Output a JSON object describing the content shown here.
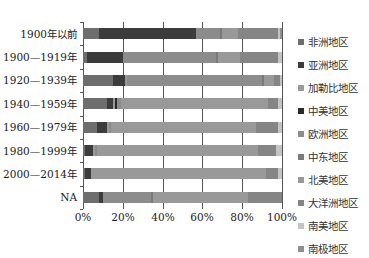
{
  "chart_data": {
    "type": "bar",
    "orientation": "horizontal",
    "stacked": "percent",
    "title": "",
    "xlabel": "",
    "ylabel": "",
    "xlim": [
      0,
      100
    ],
    "x_ticks": [
      "0%",
      "20%",
      "40%",
      "60%",
      "80%",
      "100%"
    ],
    "grid": true,
    "legend_position": "right",
    "categories": [
      "1900年以前",
      "1900—1919年",
      "1920—1939年",
      "1940—1959年",
      "1960—1979年",
      "1980—1999年",
      "2000—2014年",
      "NA"
    ],
    "series": [
      {
        "name": "非洲地区",
        "color": "#6e6e6e",
        "values": [
          8,
          2,
          15,
          12,
          7,
          1,
          1,
          8
        ]
      },
      {
        "name": "亚洲地区",
        "color": "#3c3c3c",
        "values": [
          49,
          18,
          6,
          3,
          5,
          4,
          3,
          2
        ]
      },
      {
        "name": "加勒比地区",
        "color": "#9a9a9a",
        "values": [
          0,
          0,
          1,
          1,
          1,
          1,
          1,
          0
        ]
      },
      {
        "name": "中美地区",
        "color": "#2a2a2a",
        "values": [
          0,
          0,
          0,
          1,
          0,
          0,
          0,
          0
        ]
      },
      {
        "name": "欧洲地区",
        "color": "#8c8c8c",
        "values": [
          12,
          47,
          68,
          2,
          1,
          1,
          0,
          24
        ]
      },
      {
        "name": "中东地区",
        "color": "#7a7a7a",
        "values": [
          1,
          1,
          1,
          0,
          0,
          0,
          0,
          1
        ]
      },
      {
        "name": "北美地区",
        "color": "#999999",
        "values": [
          8,
          11,
          5,
          74,
          73,
          81,
          87,
          48
        ]
      },
      {
        "name": "大洋洲地区",
        "color": "#858585",
        "values": [
          20,
          19,
          3,
          5,
          11,
          9,
          6,
          17
        ]
      },
      {
        "name": "南美地区",
        "color": "#c4c4c4",
        "values": [
          1,
          2,
          1,
          2,
          2,
          3,
          2,
          0
        ]
      },
      {
        "name": "南极地区",
        "color": "#8f8f8f",
        "values": [
          1,
          0,
          0,
          0,
          0,
          0,
          0,
          0
        ]
      }
    ]
  },
  "legend": {
    "items": [
      {
        "label": "非洲地区",
        "color": "#6e6e6e"
      },
      {
        "label": "亚洲地区",
        "color": "#3c3c3c"
      },
      {
        "label": "加勒比地区",
        "color": "#9a9a9a"
      },
      {
        "label": "中美地区",
        "color": "#2a2a2a"
      },
      {
        "label": "欧洲地区",
        "color": "#8c8c8c"
      },
      {
        "label": "中东地区",
        "color": "#7a7a7a"
      },
      {
        "label": "北美地区",
        "color": "#999999"
      },
      {
        "label": "大洋洲地区",
        "color": "#858585"
      },
      {
        "label": "南美地区",
        "color": "#c4c4c4"
      },
      {
        "label": "南极地区",
        "color": "#8f8f8f"
      }
    ]
  }
}
